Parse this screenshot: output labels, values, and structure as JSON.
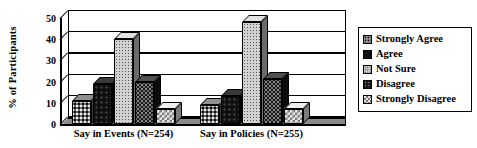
{
  "chart_data": {
    "type": "bar",
    "title": "",
    "xlabel": "",
    "ylabel": "% of Participants",
    "ylim": [
      0,
      50
    ],
    "ytick_labels": [
      "0",
      "10",
      "20",
      "30",
      "40",
      "50"
    ],
    "yticks": [
      0,
      10,
      20,
      30,
      40,
      50
    ],
    "grid": true,
    "legend_position": "right",
    "style": "3d-grouped-bar-grayscale",
    "categories": [
      "Say in Events (N=254)",
      "Say in Policies (N=255)"
    ],
    "series": [
      {
        "name": "Strongly Agree",
        "values": [
          11,
          9
        ],
        "pattern": "dark-dotted-grid",
        "color": "#6e6e6e"
      },
      {
        "name": "Agree",
        "values": [
          19,
          13
        ],
        "pattern": "solid-black",
        "color": "#101010"
      },
      {
        "name": "Not Sure",
        "values": [
          40,
          48
        ],
        "pattern": "light-fine-dots",
        "color": "#d2d2d2"
      },
      {
        "name": "Disagree",
        "values": [
          20,
          21
        ],
        "pattern": "dark-textured",
        "color": "#1c1c1c"
      },
      {
        "name": "Strongly Disagree",
        "values": [
          7,
          7
        ],
        "pattern": "light-checker",
        "color": "#e3e3e3"
      }
    ]
  },
  "legend": {
    "items": [
      {
        "label": "Strongly Agree"
      },
      {
        "label": "Agree"
      },
      {
        "label": "Not Sure"
      },
      {
        "label": "Disagree"
      },
      {
        "label": "Strongly Disagree"
      }
    ]
  }
}
